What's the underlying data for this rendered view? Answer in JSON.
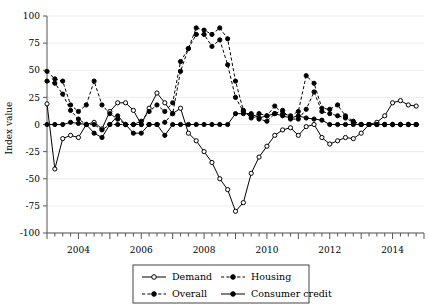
{
  "chart_data": {
    "type": "line",
    "title": "",
    "xlabel": "",
    "ylabel": "Index value",
    "ylim": [
      -100,
      100
    ],
    "yticks": [
      -100,
      -75,
      -50,
      -25,
      0,
      25,
      50,
      75,
      100
    ],
    "ytick_labels": [
      "-100",
      "-75",
      "-50",
      "-25",
      "0",
      "25",
      "50",
      "75",
      "100"
    ],
    "xlim": [
      2003.0,
      2015.0
    ],
    "xticks": [
      2004,
      2006,
      2008,
      2010,
      2012,
      2014
    ],
    "xtick_labels": [
      "2004",
      "2006",
      "2008",
      "2010",
      "2012",
      "2014"
    ],
    "minor_xtick_interval": 0.25,
    "grid": "horizontal-light",
    "legend_position": "bottom-center",
    "x": [
      2003.0,
      2003.25,
      2003.5,
      2003.75,
      2004.0,
      2004.25,
      2004.5,
      2004.75,
      2005.0,
      2005.25,
      2005.5,
      2005.75,
      2006.0,
      2006.25,
      2006.5,
      2006.75,
      2007.0,
      2007.25,
      2007.5,
      2007.75,
      2008.0,
      2008.25,
      2008.5,
      2008.75,
      2009.0,
      2009.25,
      2009.5,
      2009.75,
      2010.0,
      2010.25,
      2010.5,
      2010.75,
      2011.0,
      2011.25,
      2011.5,
      2011.75,
      2012.0,
      2012.25,
      2012.5,
      2012.75,
      2013.0,
      2013.25,
      2013.5,
      2013.75,
      2014.0,
      2014.25,
      2014.5,
      2014.75
    ],
    "series": [
      {
        "name": "Demand",
        "line_style": "solid",
        "marker": "open-circle",
        "color": "#000000",
        "values": [
          19,
          -41,
          -13,
          -10,
          -12,
          0,
          2,
          -4,
          12,
          20,
          20,
          13,
          0,
          15,
          29,
          20,
          10,
          15,
          -8,
          -15,
          -25,
          -35,
          -50,
          -60,
          -80,
          -72,
          -45,
          -30,
          -20,
          -10,
          -5,
          -3,
          -10,
          -2,
          0,
          -12,
          -18,
          -15,
          -12,
          -13,
          -8,
          0,
          2,
          8,
          20,
          22,
          18,
          17
        ]
      },
      {
        "name": "Overall",
        "line_style": "dashed",
        "marker": "filled-circle",
        "color": "#000000",
        "values": [
          40,
          38,
          28,
          13,
          5,
          0,
          0,
          -5,
          0,
          0,
          0,
          0,
          0,
          0,
          0,
          2,
          10,
          49,
          70,
          83,
          83,
          72,
          78,
          55,
          25,
          12,
          8,
          5,
          3,
          10,
          13,
          5,
          5,
          14,
          30,
          12,
          10,
          8,
          6,
          2,
          0,
          0,
          0,
          0,
          0,
          0,
          0,
          0
        ]
      },
      {
        "name": "Housing",
        "line_style": "dashed",
        "marker": "filled-circle",
        "color": "#000000",
        "values": [
          49,
          42,
          40,
          18,
          12,
          18,
          40,
          18,
          10,
          5,
          0,
          0,
          3,
          12,
          18,
          12,
          20,
          58,
          70,
          89,
          87,
          83,
          89,
          79,
          40,
          13,
          6,
          10,
          8,
          17,
          10,
          8,
          12,
          45,
          38,
          15,
          14,
          18,
          8,
          3,
          0,
          0,
          0,
          0,
          0,
          0,
          0,
          0
        ]
      },
      {
        "name": "Consumer credit",
        "line_style": "solid",
        "marker": "filled-circle",
        "color": "#000000",
        "values": [
          0,
          0,
          0,
          2,
          1,
          0,
          -8,
          -12,
          0,
          8,
          0,
          -8,
          -8,
          0,
          0,
          -10,
          0,
          0,
          0,
          0,
          0,
          0,
          0,
          0,
          10,
          10,
          10,
          6,
          8,
          10,
          8,
          6,
          8,
          6,
          5,
          4,
          0,
          0,
          0,
          0,
          0,
          0,
          0,
          0,
          0,
          0,
          0,
          0
        ]
      }
    ],
    "legend": [
      {
        "label": "Demand",
        "line_style": "solid",
        "marker": "open-circle"
      },
      {
        "label": "Housing",
        "line_style": "dashed",
        "marker": "filled-circle"
      },
      {
        "label": "Overall",
        "line_style": "dashed",
        "marker": "filled-circle"
      },
      {
        "label": "Consumer credit",
        "line_style": "solid",
        "marker": "filled-circle"
      }
    ]
  }
}
